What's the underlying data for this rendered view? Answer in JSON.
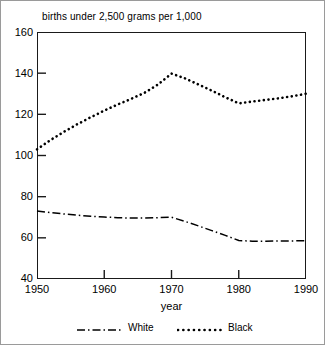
{
  "chart_data": {
    "type": "line",
    "title": "births under 2,500 grams per 1,000",
    "xlabel": "year",
    "ylabel": "",
    "xlim": [
      1950,
      1990
    ],
    "ylim": [
      40,
      160
    ],
    "xticks": [
      1950,
      1960,
      1970,
      1980,
      1990
    ],
    "yticks": [
      40,
      60,
      80,
      100,
      120,
      140,
      160
    ],
    "grid": false,
    "legend_position": "below",
    "x": [
      1950,
      1952,
      1954,
      1956,
      1958,
      1960,
      1962,
      1964,
      1966,
      1968,
      1970,
      1972,
      1974,
      1976,
      1978,
      1980,
      1982,
      1984,
      1986,
      1988,
      1990
    ],
    "series": [
      {
        "name": "White",
        "linestyle": "dash-dot",
        "color": "#000000",
        "values": [
          73.0,
          72.3,
          71.6,
          71.0,
          70.5,
          70.1,
          69.8,
          69.6,
          69.6,
          69.8,
          70.0,
          68.0,
          65.8,
          63.5,
          61.2,
          58.7,
          58.4,
          58.4,
          58.5,
          58.5,
          58.6
        ]
      },
      {
        "name": "Black",
        "linestyle": "dotted",
        "color": "#000000",
        "values": [
          103.0,
          107.5,
          111.5,
          115.2,
          118.6,
          121.8,
          124.8,
          127.5,
          130.5,
          134.5,
          139.8,
          137.5,
          134.5,
          131.5,
          128.3,
          125.3,
          126.2,
          127.0,
          127.8,
          128.8,
          130.0
        ]
      }
    ]
  },
  "axes": {
    "y_tick_labels": [
      "160",
      "140",
      "120",
      "100",
      "80",
      "60",
      "40"
    ],
    "x_tick_labels": [
      "1950",
      "1960",
      "1970",
      "1980",
      "1990"
    ],
    "x_axis_title": "year"
  },
  "legend": {
    "entries": [
      {
        "label": "White",
        "style": "dash-dot"
      },
      {
        "label": "Black",
        "style": "dotted"
      }
    ]
  },
  "colors": {
    "ink": "#000000",
    "frame": "#1a1a1a",
    "border": "#9a9a9a",
    "background": "#ffffff"
  }
}
